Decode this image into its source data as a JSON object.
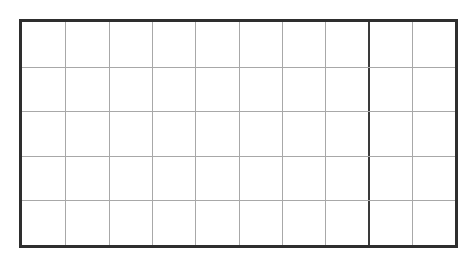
{
  "grid": {
    "columns": 10,
    "rows": 5,
    "frame": {
      "left": 19,
      "top": 19,
      "width": 439,
      "height": 229
    },
    "colors": {
      "border": "#2e2e2e",
      "minor_line": "#a8a8a8",
      "heavy_line": "#3a3a3a",
      "background": "#ffffff"
    },
    "heavy_vertical_after_column": 8
  }
}
